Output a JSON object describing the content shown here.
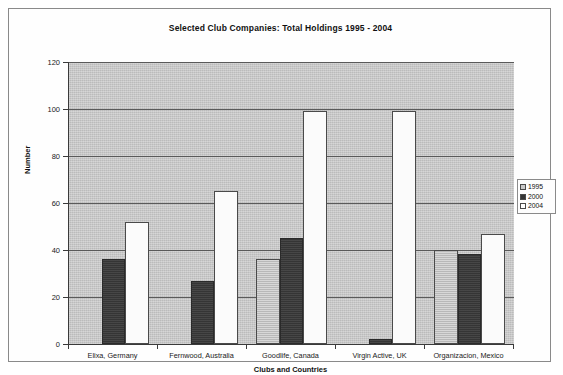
{
  "chart_data": {
    "type": "bar",
    "title": "Selected Club Companies: Total Holdings 1995 - 2004",
    "xlabel": "Clubs and Countries",
    "ylabel": "Number",
    "ylim": [
      0,
      120
    ],
    "yticks": [
      0,
      20,
      40,
      60,
      80,
      100,
      120
    ],
    "grid": true,
    "legend_position": "right",
    "categories": [
      "Elixa, Germany",
      "Fernwood, Australia",
      "Goodlife, Canada",
      "Virgin Active, UK",
      "Organizacion, Mexico"
    ],
    "series": [
      {
        "name": "1995",
        "color": "#c9c9c9",
        "values": [
          0,
          0,
          36,
          0,
          40
        ]
      },
      {
        "name": "2000",
        "color": "#343434",
        "values": [
          36,
          27,
          45,
          2,
          38.5
        ]
      },
      {
        "name": "2004",
        "color": "#ffffff",
        "values": [
          52,
          65,
          99,
          99,
          47
        ]
      }
    ]
  },
  "legend": {
    "items": [
      {
        "label": "1995"
      },
      {
        "label": "2000"
      },
      {
        "label": "2004"
      }
    ]
  }
}
